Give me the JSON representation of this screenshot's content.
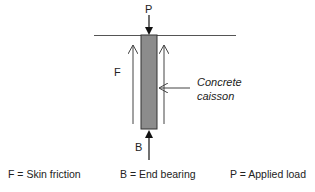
{
  "diagram": {
    "labels": {
      "load": "P",
      "friction": "F",
      "bearing": "B",
      "caisson_line1": "Concrete",
      "caisson_line2": "caisson"
    },
    "legend": [
      {
        "text": "F = Skin friction"
      },
      {
        "text": "B = End bearing"
      },
      {
        "text": "P = Applied load"
      }
    ],
    "colors": {
      "caisson_fill": "#8c8c8c",
      "line": "#444444",
      "ground_line": "#555555"
    }
  }
}
